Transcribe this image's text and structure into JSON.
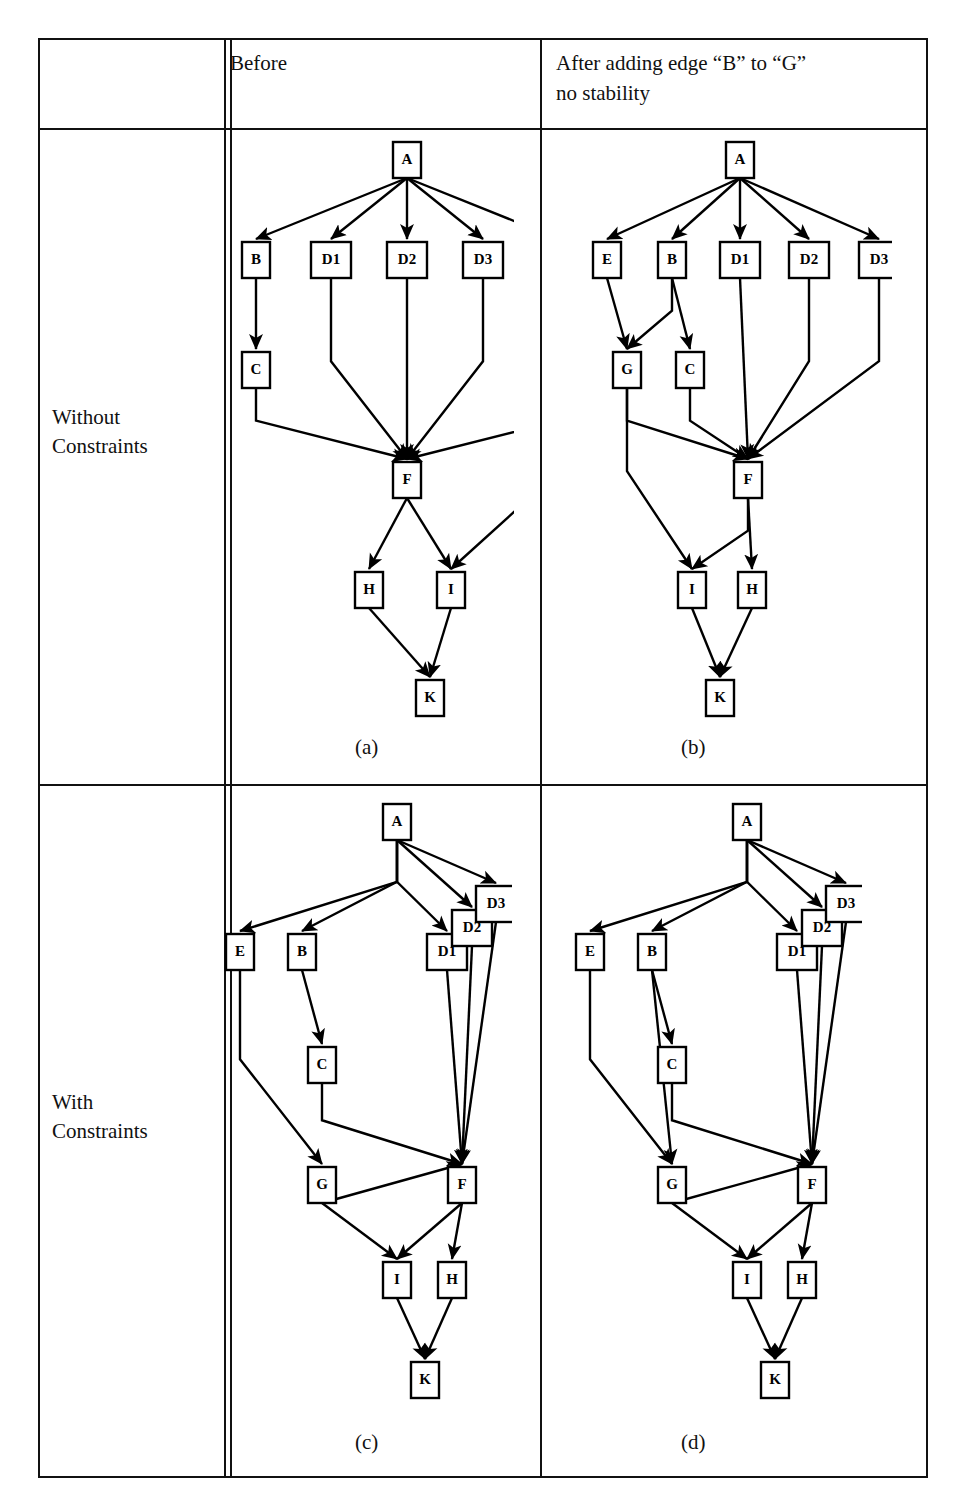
{
  "figure": {
    "kind": "graph-layout-comparison-table",
    "columns": [
      {
        "id": "rowlabel",
        "header": ""
      },
      {
        "id": "before",
        "header": "Before"
      },
      {
        "id": "after",
        "header": "After adding edge “B” to “G”\nno stability"
      }
    ],
    "rows": [
      {
        "id": "without",
        "label": "Without\nConstraints"
      },
      {
        "id": "with",
        "label": "With\nConstraints"
      }
    ],
    "captions": {
      "a": "(a)",
      "b": "(b)",
      "c": "(c)",
      "d": "(d)"
    },
    "colors": {
      "ink": "#111111",
      "paper": "#ffffff",
      "node_fill": "#ffffff",
      "node_stroke": "#000000"
    }
  },
  "graphs": {
    "a": {
      "caption": "(a)",
      "nodes": [
        {
          "id": "A",
          "label": "A",
          "x": 193,
          "y": 22
        },
        {
          "id": "B",
          "label": "B",
          "x": 42,
          "y": 122
        },
        {
          "id": "D1",
          "label": "D1",
          "x": 117,
          "y": 122
        },
        {
          "id": "D2",
          "label": "D2",
          "x": 193,
          "y": 122
        },
        {
          "id": "D3",
          "label": "D3",
          "x": 269,
          "y": 122
        },
        {
          "id": "E",
          "label": "E",
          "x": 345,
          "y": 122
        },
        {
          "id": "C",
          "label": "C",
          "x": 42,
          "y": 232
        },
        {
          "id": "G",
          "label": "G",
          "x": 345,
          "y": 232
        },
        {
          "id": "F",
          "label": "F",
          "x": 193,
          "y": 342
        },
        {
          "id": "H",
          "label": "H",
          "x": 155,
          "y": 452
        },
        {
          "id": "I",
          "label": "I",
          "x": 237,
          "y": 452
        },
        {
          "id": "K",
          "label": "K",
          "x": 216,
          "y": 560
        }
      ],
      "edges": [
        [
          "A",
          "B"
        ],
        [
          "A",
          "D1"
        ],
        [
          "A",
          "D2"
        ],
        [
          "A",
          "D3"
        ],
        [
          "A",
          "E"
        ],
        [
          "B",
          "C"
        ],
        [
          "E",
          "G"
        ],
        [
          "C",
          "F"
        ],
        [
          "D1",
          "F"
        ],
        [
          "D2",
          "F"
        ],
        [
          "D3",
          "F"
        ],
        [
          "G",
          "F"
        ],
        [
          "F",
          "H"
        ],
        [
          "F",
          "I"
        ],
        [
          "G",
          "I"
        ],
        [
          "H",
          "K"
        ],
        [
          "I",
          "K"
        ]
      ]
    },
    "b": {
      "caption": "(b)",
      "nodes": [
        {
          "id": "A",
          "label": "A",
          "x": 188,
          "y": 22
        },
        {
          "id": "E",
          "label": "E",
          "x": 55,
          "y": 122
        },
        {
          "id": "B",
          "label": "B",
          "x": 120,
          "y": 122
        },
        {
          "id": "D1",
          "label": "D1",
          "x": 188,
          "y": 122
        },
        {
          "id": "D2",
          "label": "D2",
          "x": 257,
          "y": 122
        },
        {
          "id": "D3",
          "label": "D3",
          "x": 327,
          "y": 122
        },
        {
          "id": "G",
          "label": "G",
          "x": 75,
          "y": 232
        },
        {
          "id": "C",
          "label": "C",
          "x": 138,
          "y": 232
        },
        {
          "id": "F",
          "label": "F",
          "x": 196,
          "y": 342
        },
        {
          "id": "I",
          "label": "I",
          "x": 140,
          "y": 452
        },
        {
          "id": "H",
          "label": "H",
          "x": 200,
          "y": 452
        },
        {
          "id": "K",
          "label": "K",
          "x": 168,
          "y": 560
        }
      ],
      "edges": [
        [
          "A",
          "E"
        ],
        [
          "A",
          "B"
        ],
        [
          "A",
          "D1"
        ],
        [
          "A",
          "D2"
        ],
        [
          "A",
          "D3"
        ],
        [
          "E",
          "G"
        ],
        [
          "B",
          "G"
        ],
        [
          "B",
          "C"
        ],
        [
          "G",
          "F"
        ],
        [
          "C",
          "F"
        ],
        [
          "D1",
          "F"
        ],
        [
          "D2",
          "F"
        ],
        [
          "D3",
          "F"
        ],
        [
          "F",
          "I"
        ],
        [
          "F",
          "H"
        ],
        [
          "G",
          "I"
        ],
        [
          "I",
          "K"
        ],
        [
          "H",
          "K"
        ]
      ]
    },
    "c": {
      "caption": "(c)",
      "nodes": [
        {
          "id": "A",
          "label": "A",
          "x": 185,
          "y": 22
        },
        {
          "id": "E",
          "label": "E",
          "x": 28,
          "y": 152
        },
        {
          "id": "B",
          "label": "B",
          "x": 90,
          "y": 152
        },
        {
          "id": "D1",
          "label": "D1",
          "x": 235,
          "y": 152
        },
        {
          "id": "D2",
          "label": "D2",
          "x": 260,
          "y": 128
        },
        {
          "id": "D3",
          "label": "D3",
          "x": 284,
          "y": 104
        },
        {
          "id": "C",
          "label": "C",
          "x": 110,
          "y": 265
        },
        {
          "id": "G",
          "label": "G",
          "x": 110,
          "y": 385
        },
        {
          "id": "F",
          "label": "F",
          "x": 250,
          "y": 385
        },
        {
          "id": "I",
          "label": "I",
          "x": 185,
          "y": 480
        },
        {
          "id": "H",
          "label": "H",
          "x": 240,
          "y": 480
        },
        {
          "id": "K",
          "label": "K",
          "x": 213,
          "y": 580
        }
      ],
      "edges": [
        [
          "A",
          "E"
        ],
        [
          "A",
          "B"
        ],
        [
          "A",
          "D1"
        ],
        [
          "A",
          "D2"
        ],
        [
          "A",
          "D3"
        ],
        [
          "B",
          "C"
        ],
        [
          "E",
          "G"
        ],
        [
          "C",
          "F"
        ],
        [
          "D1",
          "F"
        ],
        [
          "D2",
          "F"
        ],
        [
          "D3",
          "F"
        ],
        [
          "G",
          "F"
        ],
        [
          "G",
          "I"
        ],
        [
          "F",
          "I"
        ],
        [
          "F",
          "H"
        ],
        [
          "I",
          "K"
        ],
        [
          "H",
          "K"
        ]
      ]
    },
    "d": {
      "caption": "(d)",
      "nodes": [
        {
          "id": "A",
          "label": "A",
          "x": 185,
          "y": 22
        },
        {
          "id": "E",
          "label": "E",
          "x": 28,
          "y": 152
        },
        {
          "id": "B",
          "label": "B",
          "x": 90,
          "y": 152
        },
        {
          "id": "D1",
          "label": "D1",
          "x": 235,
          "y": 152
        },
        {
          "id": "D2",
          "label": "D2",
          "x": 260,
          "y": 128
        },
        {
          "id": "D3",
          "label": "D3",
          "x": 284,
          "y": 104
        },
        {
          "id": "C",
          "label": "C",
          "x": 110,
          "y": 265
        },
        {
          "id": "G",
          "label": "G",
          "x": 110,
          "y": 385
        },
        {
          "id": "F",
          "label": "F",
          "x": 250,
          "y": 385
        },
        {
          "id": "I",
          "label": "I",
          "x": 185,
          "y": 480
        },
        {
          "id": "H",
          "label": "H",
          "x": 240,
          "y": 480
        },
        {
          "id": "K",
          "label": "K",
          "x": 213,
          "y": 580
        }
      ],
      "edges": [
        [
          "A",
          "E"
        ],
        [
          "A",
          "B"
        ],
        [
          "A",
          "D1"
        ],
        [
          "A",
          "D2"
        ],
        [
          "A",
          "D3"
        ],
        [
          "B",
          "C"
        ],
        [
          "B",
          "G"
        ],
        [
          "E",
          "G"
        ],
        [
          "C",
          "F"
        ],
        [
          "D1",
          "F"
        ],
        [
          "D2",
          "F"
        ],
        [
          "D3",
          "F"
        ],
        [
          "G",
          "F"
        ],
        [
          "G",
          "I"
        ],
        [
          "F",
          "I"
        ],
        [
          "F",
          "H"
        ],
        [
          "I",
          "K"
        ],
        [
          "H",
          "K"
        ]
      ]
    }
  }
}
